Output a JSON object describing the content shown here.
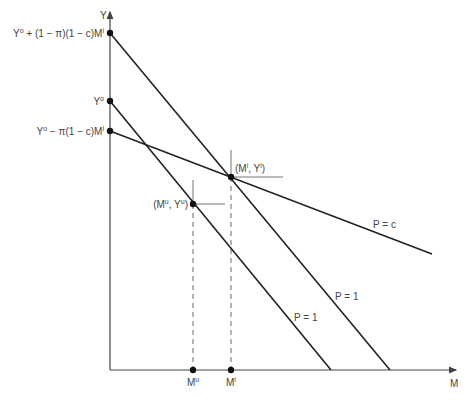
{
  "axes": {
    "x_label": "M",
    "y_label": "Y"
  },
  "y_intercepts": {
    "top": "Yᴼ + (1 − π)(1 − c)Mᴵ",
    "top_parts": {
      "a": "Y",
      "a_sup": "o",
      "b": " + (1 − π)(1 − c)M",
      "b_sup": "i"
    },
    "middle_parts": {
      "a": "Y",
      "a_sup": "o"
    },
    "bottom_parts": {
      "a": "Y",
      "a_sup": "o",
      "b": " − π(1 − c)M",
      "b_sup": "i"
    }
  },
  "points": {
    "informed": {
      "label_a": "(M",
      "sup1": "i",
      "label_b": ", Y",
      "sup2": "i",
      "label_c": ")"
    },
    "uninformed": {
      "label_a": "(M",
      "sup1": "u",
      "label_b": ", Y",
      "sup2": "u",
      "label_c": ")"
    }
  },
  "x_ticks": {
    "mu": {
      "base": "M",
      "sup": "u"
    },
    "mi": {
      "base": "M",
      "sup": "i"
    }
  },
  "line_labels": {
    "p_c": "P = c",
    "p1_upper": "P = 1",
    "p1_lower": "P = 1"
  },
  "colors": {
    "line": "#222222",
    "axis": "#444444",
    "guide": "#777777",
    "text": "#444444"
  }
}
